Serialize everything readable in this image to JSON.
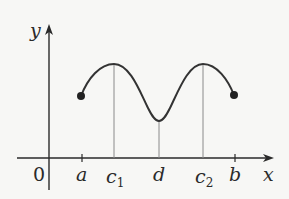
{
  "diagram": {
    "axes": {
      "x_label": "x",
      "y_label": "y",
      "origin_label": "0"
    },
    "ticks": [
      {
        "id": "a",
        "label": "a",
        "sub": ""
      },
      {
        "id": "c1",
        "label": "c",
        "sub": "1"
      },
      {
        "id": "d",
        "label": "d",
        "sub": ""
      },
      {
        "id": "c2",
        "label": "c",
        "sub": "2"
      },
      {
        "id": "b",
        "label": "b",
        "sub": ""
      }
    ],
    "curve": {
      "description": "continuous function on [a,b] with local maxima at c1 and c2, local minimum at d, closed endpoints at a and b",
      "color": "#333333"
    }
  }
}
